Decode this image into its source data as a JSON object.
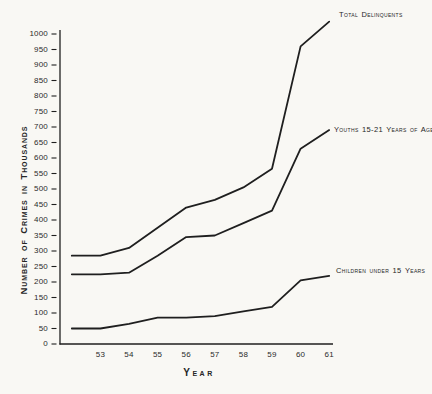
{
  "chart_data": {
    "type": "line",
    "title": "",
    "xlabel": "Year",
    "ylabel": "Number of Crimes in Thousands",
    "units": "thousands of crimes",
    "x_years": [
      1952,
      1953,
      1954,
      1955,
      1956,
      1957,
      1958,
      1959,
      1960,
      1961
    ],
    "x_tick_labels": [
      "53",
      "54",
      "55",
      "56",
      "57",
      "58",
      "59",
      "60",
      "61"
    ],
    "y_ticks": [
      0,
      50,
      100,
      150,
      200,
      250,
      300,
      350,
      400,
      450,
      500,
      550,
      600,
      650,
      700,
      750,
      800,
      850,
      900,
      950,
      1000
    ],
    "ylim": [
      0,
      1050
    ],
    "grid": false,
    "legend_position": "line-end-labels",
    "line_color": "#1f1f1f",
    "background": "#f9f8f4",
    "series": [
      {
        "name": "Total Delinquents",
        "values": [
          285,
          285,
          310,
          375,
          440,
          465,
          505,
          565,
          960,
          1040
        ],
        "label_pos": {
          "x": 339,
          "y": 10
        }
      },
      {
        "name": "Youths 15-21 Years of Age",
        "values": [
          225,
          225,
          230,
          285,
          345,
          350,
          390,
          430,
          630,
          690
        ],
        "label_pos": {
          "x": 334,
          "y": 125
        }
      },
      {
        "name": "Children under 15 Years",
        "values": [
          50,
          50,
          65,
          85,
          85,
          90,
          105,
          120,
          205,
          220
        ],
        "label_pos": {
          "x": 336,
          "y": 266
        }
      }
    ]
  }
}
